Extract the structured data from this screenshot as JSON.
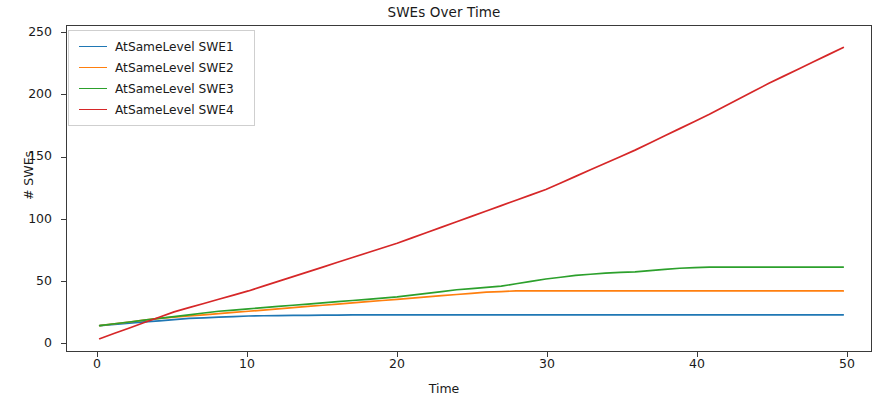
{
  "chart_data": {
    "type": "line",
    "title": "SWEs Over Time",
    "xlabel": "Time",
    "ylabel": "# SWEs",
    "xlim": [
      -2.2,
      52.0
    ],
    "ylim": [
      -12,
      262
    ],
    "xticks": [
      0,
      10,
      20,
      30,
      40,
      50
    ],
    "yticks": [
      0,
      50,
      100,
      150,
      200,
      250
    ],
    "grid": false,
    "legend_position": "upper left",
    "x": [
      0,
      1,
      2,
      3,
      4,
      5,
      6,
      7,
      8,
      9,
      10,
      11,
      12,
      13,
      14,
      15,
      16,
      17,
      18,
      19,
      20,
      21,
      22,
      23,
      24,
      25,
      26,
      27,
      28,
      29,
      30,
      31,
      32,
      33,
      34,
      35,
      36,
      37,
      38,
      39,
      40,
      41,
      42,
      43,
      44,
      45,
      46,
      47,
      48,
      49,
      50
    ],
    "series": [
      {
        "name": "AtSameLevel SWE1",
        "color": "#1f77b4",
        "values": [
          11,
          12,
          13,
          14,
          15,
          16,
          17,
          17.5,
          18,
          18.5,
          19,
          19.2,
          19.4,
          19.5,
          19.6,
          19.7,
          19.8,
          19.9,
          20,
          20,
          20,
          20,
          20,
          20,
          20,
          20,
          20,
          20,
          20,
          20,
          20,
          20,
          20,
          20,
          20,
          20,
          20,
          20,
          20,
          20,
          20,
          20,
          20,
          20,
          20,
          20,
          20,
          20,
          20,
          20,
          20
        ]
      },
      {
        "name": "AtSameLevel SWE2",
        "color": "#ff7f0e",
        "values": [
          11,
          12.5,
          14,
          15.5,
          17,
          18,
          19,
          20,
          21,
          22,
          23,
          24,
          25,
          26,
          27,
          28,
          29,
          30,
          31,
          32,
          33,
          34,
          35,
          36,
          37,
          38,
          39,
          39.5,
          40,
          40,
          40,
          40,
          40,
          40,
          40,
          40,
          40,
          40,
          40,
          40,
          40,
          40,
          40,
          40,
          40,
          40,
          40,
          40,
          40,
          40,
          40
        ]
      },
      {
        "name": "AtSameLevel SWE3",
        "color": "#2ca02c",
        "values": [
          11,
          12.5,
          14,
          15.5,
          17,
          18.5,
          20,
          21.5,
          23,
          24,
          25,
          26,
          27,
          28,
          29,
          30,
          31,
          32,
          33,
          34,
          35,
          36.5,
          38,
          39.5,
          41,
          42,
          43,
          44,
          46,
          48,
          50,
          51.5,
          53,
          54,
          55,
          55.5,
          56,
          57,
          58,
          59,
          59.5,
          60,
          60,
          60,
          60,
          60,
          60,
          60,
          60,
          60,
          60
        ]
      },
      {
        "name": "AtSameLevel SWE4",
        "color": "#d62728",
        "values": [
          0,
          4.5,
          9,
          13.5,
          18,
          22.5,
          26,
          29.5,
          33,
          36.5,
          40,
          44,
          48,
          52,
          56,
          60,
          64,
          68,
          72,
          76,
          80,
          84.5,
          89,
          93.5,
          98,
          102.5,
          107,
          111.5,
          116,
          120.5,
          125,
          130.5,
          136,
          141.5,
          147,
          152.5,
          158,
          164,
          170,
          176,
          182,
          188,
          194.5,
          201,
          207.5,
          214,
          220,
          226,
          232,
          238,
          244
        ]
      }
    ]
  },
  "axis": {
    "yticklabels": [
      "250",
      "200",
      "150",
      "100",
      "50",
      "0"
    ],
    "xticklabels": [
      "0",
      "10",
      "20",
      "30",
      "40",
      "50"
    ]
  }
}
